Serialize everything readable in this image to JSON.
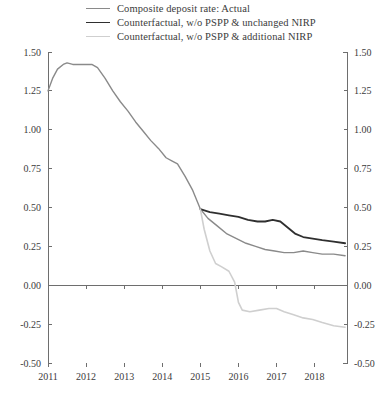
{
  "chart_data": {
    "type": "line",
    "title": "",
    "subtitle": "",
    "xlabel": "",
    "ylabel": "",
    "xlim": [
      2011,
      2018.85
    ],
    "ylim": [
      -0.5,
      1.5
    ],
    "grid": false,
    "legend_position": "top",
    "x_ticks": [
      "2011",
      "2012",
      "2013",
      "2014",
      "2015",
      "2016",
      "2017",
      "2018"
    ],
    "x_tick_values": [
      2011,
      2012,
      2013,
      2014,
      2015,
      2016,
      2017,
      2018
    ],
    "y_ticks": [
      "1.50",
      "1.25",
      "1.00",
      "0.75",
      "0.50",
      "0.25",
      "0.00",
      "-0.25",
      "-0.50"
    ],
    "y_tick_values": [
      1.5,
      1.25,
      1.0,
      0.75,
      0.5,
      0.25,
      0.0,
      -0.25,
      -0.5
    ],
    "y_axis_right_mirror": true,
    "zero_line": 0.0,
    "series": [
      {
        "name": "Composite deposit rate: Actual",
        "color": "#8a8a8a",
        "width": 1.4,
        "x": [
          2011.0,
          2011.12,
          2011.25,
          2011.4,
          2011.5,
          2011.65,
          2011.8,
          2012.0,
          2012.15,
          2012.3,
          2012.5,
          2012.7,
          2012.9,
          2013.1,
          2013.3,
          2013.5,
          2013.7,
          2013.9,
          2014.1,
          2014.25,
          2014.4,
          2014.6,
          2014.8,
          2015.0,
          2015.2,
          2015.45,
          2015.7,
          2015.95,
          2016.2,
          2016.45,
          2016.7,
          2016.95,
          2017.2,
          2017.45,
          2017.7,
          2017.95,
          2018.2,
          2018.5,
          2018.8
        ],
        "y": [
          1.25,
          1.33,
          1.39,
          1.42,
          1.43,
          1.42,
          1.42,
          1.42,
          1.42,
          1.4,
          1.33,
          1.25,
          1.18,
          1.12,
          1.05,
          0.99,
          0.93,
          0.88,
          0.82,
          0.8,
          0.78,
          0.7,
          0.61,
          0.49,
          0.43,
          0.38,
          0.33,
          0.3,
          0.27,
          0.25,
          0.23,
          0.22,
          0.21,
          0.21,
          0.22,
          0.21,
          0.2,
          0.2,
          0.19
        ]
      },
      {
        "name": "Counterfactual, w/o PSPP & unchanged NIRP",
        "color": "#2f2f2f",
        "width": 1.8,
        "x": [
          2015.0,
          2015.25,
          2015.5,
          2015.75,
          2016.0,
          2016.25,
          2016.5,
          2016.7,
          2016.9,
          2017.1,
          2017.3,
          2017.5,
          2017.7,
          2017.95,
          2018.2,
          2018.5,
          2018.8
        ],
        "y": [
          0.49,
          0.47,
          0.46,
          0.45,
          0.44,
          0.42,
          0.41,
          0.41,
          0.42,
          0.41,
          0.37,
          0.33,
          0.31,
          0.3,
          0.29,
          0.28,
          0.27
        ]
      },
      {
        "name": "Counterfactual, w/o PSPP & additional NIRP",
        "color": "#cfcfcf",
        "width": 1.6,
        "x": [
          2015.0,
          2015.1,
          2015.25,
          2015.4,
          2015.55,
          2015.75,
          2015.9,
          2016.0,
          2016.1,
          2016.3,
          2016.55,
          2016.8,
          2017.0,
          2017.2,
          2017.45,
          2017.7,
          2017.95,
          2018.2,
          2018.5,
          2018.8
        ],
        "y": [
          0.49,
          0.36,
          0.22,
          0.14,
          0.12,
          0.09,
          0.02,
          -0.11,
          -0.16,
          -0.17,
          -0.16,
          -0.15,
          -0.15,
          -0.17,
          -0.19,
          -0.21,
          -0.22,
          -0.24,
          -0.26,
          -0.27
        ]
      }
    ]
  },
  "legend": {
    "items": [
      {
        "label": "Composite deposit rate: Actual",
        "color": "#8a8a8a",
        "width": 1.4
      },
      {
        "label": "Counterfactual, w/o PSPP & unchanged NIRP",
        "color": "#2f2f2f",
        "width": 1.8
      },
      {
        "label": "Counterfactual, w/o PSPP & additional NIRP",
        "color": "#cfcfcf",
        "width": 1.6
      }
    ]
  }
}
